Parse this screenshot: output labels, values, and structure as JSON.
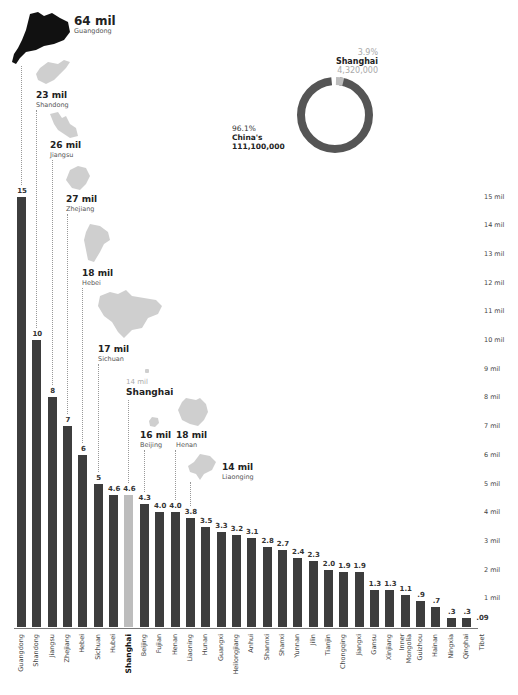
{
  "chart_data": {
    "type": "bar",
    "title": "",
    "xlabel": "",
    "ylabel": "",
    "ylim": [
      0,
      15
    ],
    "y_ticks": [
      "1 mil",
      "2 mil",
      "3 mil",
      "4 mil",
      "5 mil",
      "6 mil",
      "7 mil",
      "8 mil",
      "9 mil",
      "10 mil",
      "11 mil",
      "12 mil",
      "13 mil",
      "14 mil",
      "15 mil"
    ],
    "unit": "million",
    "categories": [
      "Guangdong",
      "Shandong",
      "Jiangsu",
      "Zhejiang",
      "Hebei",
      "Sichuan",
      "Hubei",
      "Shanghai",
      "Beijing",
      "Fujian",
      "Henan",
      "Liaoning",
      "Hunan",
      "Guangxi",
      "Heilongjiang",
      "Anhui",
      "Shannxi",
      "Shanxi",
      "Yunnan",
      "Jilin",
      "Tianjin",
      "Chongqing",
      "Jiangxi",
      "Gansu",
      "Xinjiang",
      "Inner Mongolia",
      "Guizhou",
      "Hainan",
      "Ningxia",
      "Qinghai",
      "Tibet"
    ],
    "values": [
      15,
      10,
      8,
      7,
      6,
      5,
      4.6,
      4.6,
      4.3,
      4.0,
      4.0,
      3.8,
      3.5,
      3.3,
      3.2,
      3.1,
      2.8,
      2.7,
      2.4,
      2.3,
      2.0,
      1.9,
      1.9,
      1.3,
      1.3,
      1.1,
      0.9,
      0.7,
      0.3,
      0.3,
      0.09
    ],
    "value_labels": [
      "15",
      "10",
      "8",
      "7",
      "6",
      "5",
      "4.6",
      "4.6",
      "4.3",
      "4.0",
      "4.0",
      "3.8",
      "3.5",
      "3.3",
      "3.2",
      "3.1",
      "2.8",
      "2.7",
      "2.4",
      "2.3",
      "2.0",
      "1.9",
      "1.9",
      "1.3",
      "1.3",
      "1.1",
      ".9",
      ".7",
      ".3",
      ".3",
      ".09"
    ],
    "highlight": "Shanghai",
    "colors": {
      "bar": "#3d3d3d",
      "highlight": "#bdbdbd"
    },
    "grid": false,
    "legend": "none",
    "callouts": [
      {
        "province": "Guangdong",
        "value": "64 mil",
        "bar_index": 0
      },
      {
        "province": "Shandong",
        "value": "23 mil",
        "bar_index": 1
      },
      {
        "province": "Jiangsu",
        "value": "26 mil",
        "bar_index": 2
      },
      {
        "province": "Zhejiang",
        "value": "27 mil",
        "bar_index": 3
      },
      {
        "province": "Hebei",
        "value": "18 mil",
        "bar_index": 4
      },
      {
        "province": "Sichuan",
        "value": "17 mil",
        "bar_index": 5
      },
      {
        "province": "Shanghai",
        "value": "14 mil",
        "bar_index": 7
      },
      {
        "province": "Beijing",
        "value": "16 mil",
        "bar_index": 8
      },
      {
        "province": "Henan",
        "value": "18 mil",
        "bar_index": 10
      },
      {
        "province": "Liaonging",
        "value": "14 mil",
        "bar_index": 11
      }
    ],
    "donut": {
      "type": "pie",
      "slices": [
        {
          "label": "Shanghai",
          "percent": "3.9%",
          "value": "4,320,000",
          "color": "#bdbdbd"
        },
        {
          "label": "China's",
          "percent": "96.1%",
          "value": "111,100,000",
          "color": "#555555"
        }
      ]
    }
  }
}
